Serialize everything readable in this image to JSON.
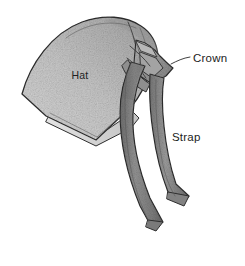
{
  "figure": {
    "background_color": "#ffffff",
    "ink_color": "#2e2e2e",
    "hat_fill_color": "#c9c9c9",
    "hat_shade_color": "#a9a9a9",
    "strap_fill_color": "#8d8d8d",
    "strap_shade_color": "#6f6f6f",
    "brim_fill_color": "#dcdcdc",
    "label_color": "#1c1c1c",
    "width": 245,
    "height": 266
  },
  "labels": {
    "hat": {
      "text": "Hat",
      "x": 80,
      "y": 79
    },
    "crown": {
      "text": "Crown",
      "x": 193,
      "y": 62
    },
    "strap": {
      "text": "Strap",
      "x": 172,
      "y": 141
    }
  },
  "callouts": [
    {
      "name": "crown-leader",
      "from_x": 172,
      "from_y": 63,
      "to_x": 190,
      "to_y": 57
    }
  ],
  "parts": [
    {
      "name": "hat-body",
      "label": "Hat"
    },
    {
      "name": "crown",
      "label": "Crown"
    },
    {
      "name": "strap",
      "label": "Strap"
    }
  ]
}
